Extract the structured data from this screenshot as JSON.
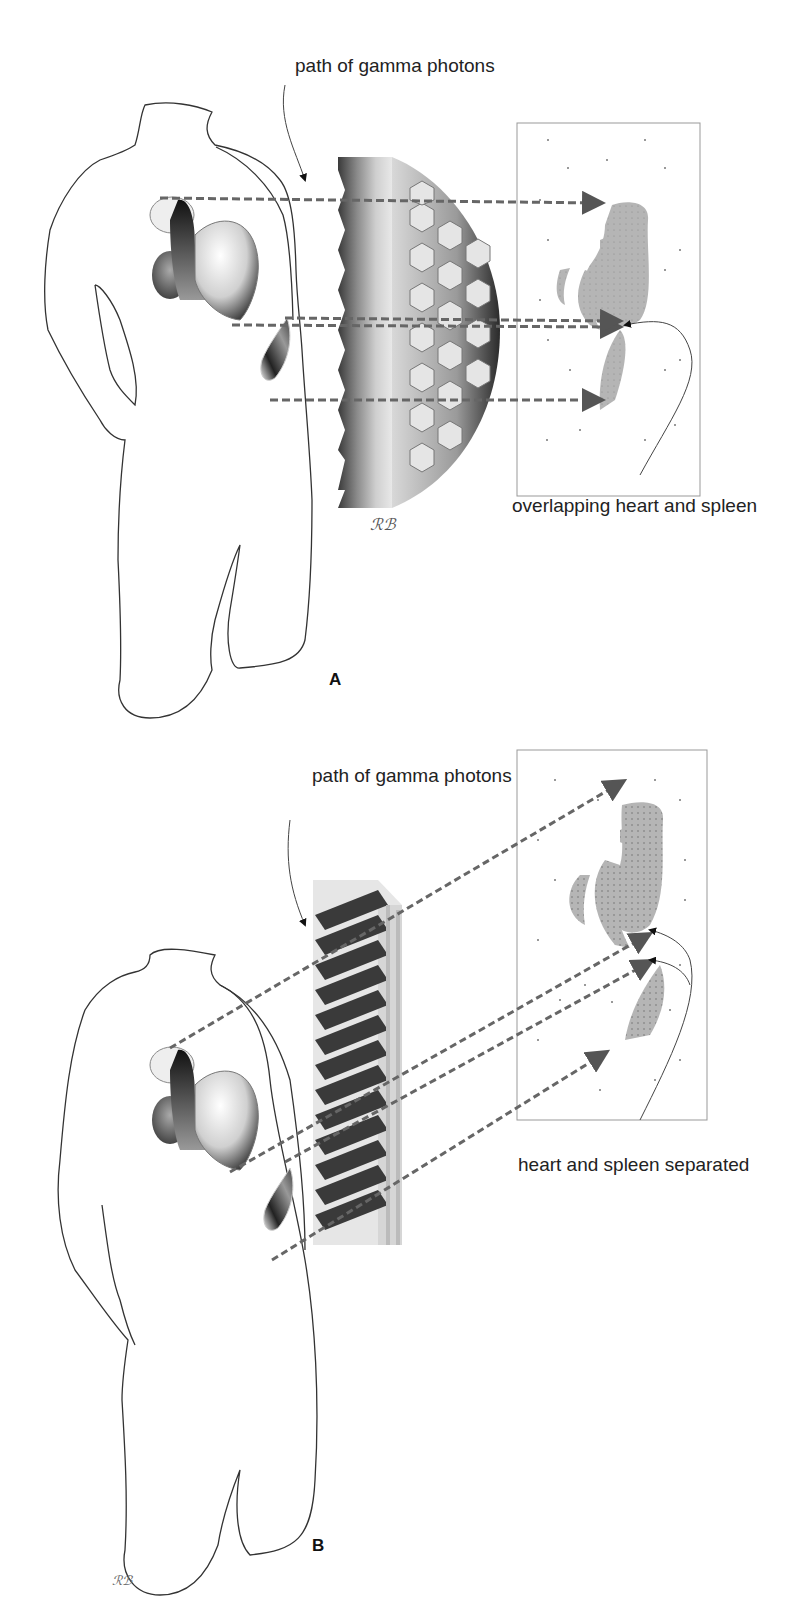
{
  "figure": {
    "panels": [
      {
        "id": "A",
        "letter": "A",
        "label_photons": "path of gamma photons",
        "label_result": "overlapping heart and spleen",
        "collimator_type": "parallel-hole (hexagonal) collimator",
        "signature": "RB"
      },
      {
        "id": "B",
        "letter": "B",
        "label_photons": "path of gamma photons",
        "label_result": "heart and spleen separated",
        "collimator_type": "slant-hole collimator",
        "signature": "RB"
      }
    ],
    "colors": {
      "outline": "#333333",
      "dashed_ray": "#666666",
      "image_blob": "#b3b3b3",
      "frame": "#999999",
      "background": "#ffffff"
    },
    "caption_truncated": ""
  }
}
